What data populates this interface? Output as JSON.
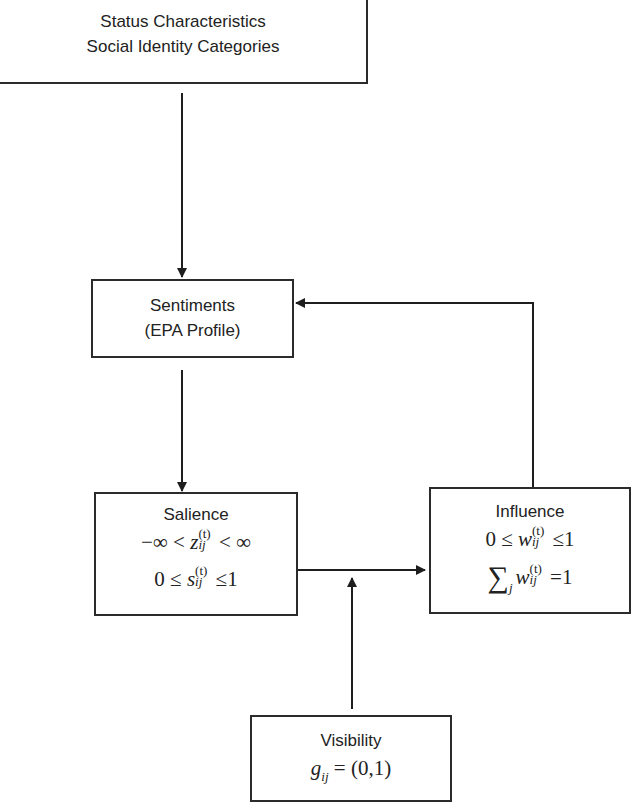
{
  "diagram": {
    "nodes": {
      "status": {
        "lines": [
          "Status Characteristics",
          "Social Identity Categories"
        ]
      },
      "sentiments": {
        "lines": [
          "Sentiments",
          "(EPA Profile)"
        ]
      },
      "salience": {
        "title": "Salience",
        "eq1": {
          "left": "−∞ < ",
          "var": "z",
          "sup": "(t)",
          "sub": "ij",
          "right": " < ∞"
        },
        "eq2": {
          "left": "0 ≤ ",
          "var": "s",
          "sup": "(t)",
          "sub": "ij",
          "right": " ≤1"
        }
      },
      "influence": {
        "title": "Influence",
        "eq1": {
          "left": "0 ≤ ",
          "var": "w",
          "sup": "(t)",
          "sub": "ij",
          "right": " ≤1"
        },
        "eq2": {
          "sigma": "∑",
          "index": "j",
          "var": "w",
          "sup": "(t)",
          "sub": "ij",
          "right": " =1"
        }
      },
      "visibility": {
        "title": "Visibility",
        "eq1": {
          "var": "g",
          "sub": "ij",
          "right": " = (0,1)"
        }
      }
    },
    "edges": [
      {
        "from": "status",
        "to": "sentiments"
      },
      {
        "from": "sentiments",
        "to": "salience"
      },
      {
        "from": "salience",
        "to": "influence"
      },
      {
        "from": "visibility",
        "to": "salience-influence-edge"
      },
      {
        "from": "influence",
        "to": "sentiments"
      }
    ],
    "colors": {
      "stroke": "#2b2b2b",
      "background": "#ffffff"
    }
  }
}
